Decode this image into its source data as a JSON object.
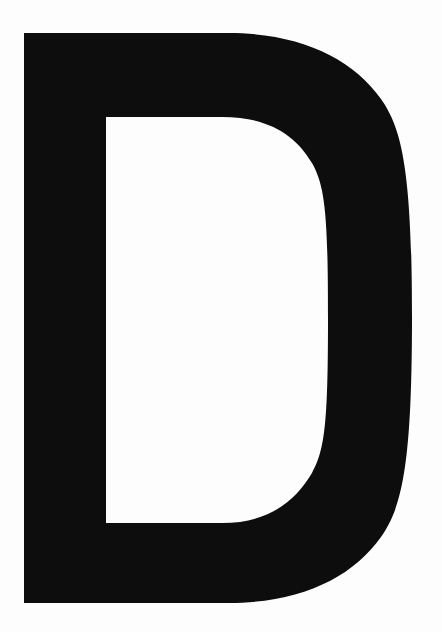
{
  "page": {
    "kind": "glyph-specimen",
    "width": 442,
    "height": 632,
    "background_color": "#fdfdfd"
  },
  "glyph": {
    "character": "D",
    "name": "latin-capital-letter-d",
    "description": "Uppercase letter D",
    "case": "uppercase",
    "script": "Latin",
    "style": "bold grotesque sans-serif",
    "fill_color": "#0d0d0d",
    "alt_text": "Black uppercase letter D on a white background"
  },
  "geometry": {
    "outer_left": 24,
    "outer_top": 33,
    "outer_right": 412,
    "outer_bottom": 603,
    "stem_width": 82,
    "counter_left": 106,
    "counter_top": 117,
    "counter_right": 328,
    "counter_bottom": 523,
    "outer_flat_end_x": 228,
    "counter_flat_end_x": 222,
    "path": "M24 33 L228 33 C300 33 352 58 381 99 C402 129 412 170 412 318 C412 466 402 507 381 537 C352 578 300 603 228 603 L24 603 Z M106 117 L222 117 C270 117 296 136 312 163 C325 186 328 214 328 318 C328 422 325 450 312 473 C296 500 270 523 222 523 L106 523 Z"
  }
}
